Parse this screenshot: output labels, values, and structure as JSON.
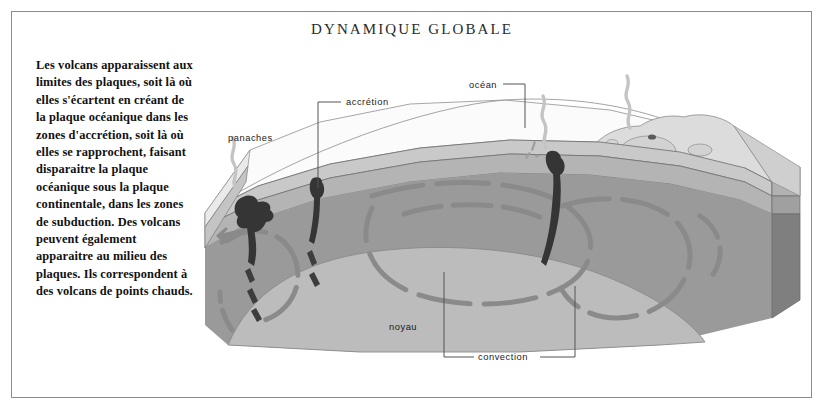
{
  "page": {
    "title": "DYNAMIQUE GLOBALE",
    "background_color": "#ffffff",
    "frame_color": "#8c8c8c"
  },
  "caption": {
    "text": "Les volcans apparaissent aux limites des plaques, soit là où elles s'écartent en créant de la plaque océanique dans les zones d'accrétion, soit là où elles se rapprochent, faisant disparaitre la plaque océanique sous la plaque continentale, dans les zones de subduction. Des volcans peuvent également apparaitre au milieu des plaques. Ils correspondent à des volcans de points chauds."
  },
  "diagram": {
    "type": "geological-block-diagram",
    "labels": [
      {
        "id": "panaches",
        "text": "panaches",
        "x": 228,
        "y": 141
      },
      {
        "id": "accretion",
        "text": "accrétion",
        "x": 346,
        "y": 105
      },
      {
        "id": "ocean",
        "text": "océan",
        "x": 469,
        "y": 88
      },
      {
        "id": "noyau",
        "text": "noyau",
        "x": 389,
        "y": 330
      },
      {
        "id": "convection",
        "text": "convection",
        "x": 478,
        "y": 360
      }
    ],
    "colors": {
      "ocean_surface": "#fbfbfb",
      "crust": "#c9c9c9",
      "upper_mantle": "#a6a6a6",
      "mantle": "#9a9a9a",
      "mantle_side": "#8f8f8f",
      "core": "#bcbcbc",
      "block_side_dark": "#7f7f7f",
      "block_side_darker": "#6e6e6e",
      "continent": "#dcdcdc",
      "magma": "#3a3a3a",
      "convection_arrow": "#8a8a8a",
      "outline": "#4a4a4a"
    }
  }
}
